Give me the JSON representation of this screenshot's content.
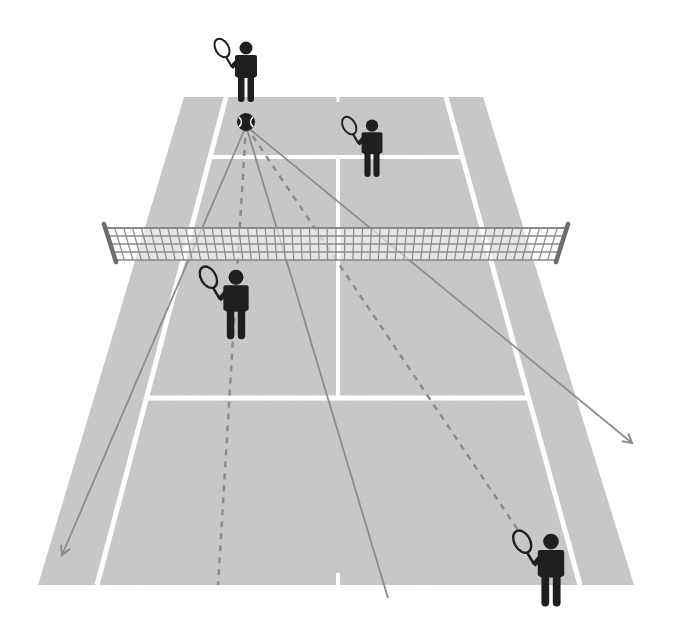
{
  "diagram": {
    "title": "Tennis doubles court - shot directions diagram",
    "colors": {
      "background": "#ffffff",
      "court": "#c8c8c8",
      "lines": "#ffffff",
      "net_mesh": "#8a8a8a",
      "net_post": "#6e6e6e",
      "shot_line": "#8c8c8c",
      "player": "#1f1f1f"
    },
    "court": {
      "outer": {
        "top_left": [
          184,
          97
        ],
        "top_right": [
          483,
          97
        ],
        "bottom_right": [
          634,
          585
        ],
        "bottom_left": [
          38,
          585
        ]
      },
      "singles_left": {
        "top": [
          226,
          97
        ],
        "bottom": [
          97,
          585
        ]
      },
      "singles_right": {
        "top": [
          446,
          97
        ],
        "bottom": [
          580,
          585
        ]
      },
      "far_service_line_y": 157,
      "near_service_line_y": 398,
      "center_line_x_top": 338,
      "center_line_x_bottom": 338
    },
    "net": {
      "left_post": [
        [
          104,
          224
        ],
        [
          116,
          262
        ]
      ],
      "right_post": [
        [
          568,
          224
        ],
        [
          556,
          262
        ]
      ],
      "top_y": 228,
      "bottom_y": 260
    },
    "ball": {
      "x": 246,
      "y": 122,
      "r": 9
    },
    "shots": [
      {
        "name": "shot-left-arrow",
        "style": "solid",
        "arrow": true,
        "to": [
          62,
          555
        ]
      },
      {
        "name": "shot-left-dashed",
        "style": "dashed",
        "arrow": false,
        "to": [
          218,
          585
        ]
      },
      {
        "name": "shot-center-solid",
        "style": "solid",
        "arrow": false,
        "to": [
          388,
          598
        ]
      },
      {
        "name": "shot-right-dashed",
        "style": "dashed",
        "arrow": false,
        "to": [
          518,
          530
        ]
      },
      {
        "name": "shot-right-arrow",
        "style": "solid",
        "arrow": true,
        "to": [
          632,
          443
        ]
      }
    ],
    "players": [
      {
        "name": "player-far-server",
        "x": 246,
        "y": 40,
        "scale": 1.0
      },
      {
        "name": "player-far-partner",
        "x": 372,
        "y": 118,
        "scale": 0.95
      },
      {
        "name": "player-near-net",
        "x": 236,
        "y": 268,
        "scale": 1.15
      },
      {
        "name": "player-near-baseline",
        "x": 551,
        "y": 532,
        "scale": 1.2
      }
    ]
  }
}
